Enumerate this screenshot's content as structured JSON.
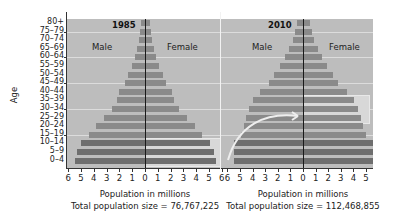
{
  "y_axis_label": "Age",
  "age_groups": [
    "80+",
    "75–79",
    "70–74",
    "65–69",
    "60–64",
    "55–59",
    "50–54",
    "45–49",
    "40–44",
    "35–39",
    "30–34",
    "25–29",
    "20–24",
    "15–19",
    "10–14",
    "5–9",
    "0–4"
  ],
  "charts": [
    {
      "year": "1985",
      "male_label": "Male",
      "female_label": "Female",
      "x_ticks_left": [
        "6",
        "5",
        "4",
        "3",
        "2",
        "1"
      ],
      "x_ticks_zero": "0",
      "x_ticks_right": [
        "1",
        "2",
        "3",
        "4",
        "5",
        "6"
      ],
      "xlabel": "Population in millions",
      "total_caption": "Total population size = 76,767,225"
    },
    {
      "year": "2010",
      "male_label": "Male",
      "female_label": "Female",
      "x_ticks_left": [
        "6",
        "5",
        "4",
        "3",
        "2",
        "1"
      ],
      "x_ticks_zero": "0",
      "x_ticks_right": [
        "1",
        "2",
        "3",
        "4",
        "5"
      ],
      "xlabel": "Population in millions",
      "total_caption": "Total population size = 112,468,855"
    }
  ],
  "colors": {
    "panel_bg": "#bdbdbd",
    "bar": "#8a8a8a",
    "bar_young": "#6e6e6e",
    "highlight": "#d8d8d8",
    "arrow": "#eeeeee"
  },
  "chart_data": [
    {
      "type": "bar",
      "title": "1985",
      "orientation": "horizontal",
      "subtype": "population pyramid",
      "categories": [
        "80+",
        "75–79",
        "70–74",
        "65–69",
        "60–64",
        "55–59",
        "50–54",
        "45–49",
        "40–44",
        "35–39",
        "30–34",
        "25–29",
        "20–24",
        "15–19",
        "10–14",
        "5–9",
        "0–4"
      ],
      "series": [
        {
          "name": "Male",
          "values": [
            0.3,
            0.4,
            0.5,
            0.6,
            0.8,
            1.0,
            1.3,
            1.6,
            2.0,
            2.2,
            2.6,
            3.2,
            3.8,
            4.4,
            5.0,
            5.3,
            5.5
          ]
        },
        {
          "name": "Female",
          "values": [
            0.3,
            0.4,
            0.5,
            0.6,
            0.8,
            1.0,
            1.3,
            1.6,
            2.0,
            2.2,
            2.6,
            3.2,
            3.8,
            4.4,
            5.0,
            5.3,
            5.5
          ]
        }
      ],
      "xlabel": "Population in millions",
      "ylabel": "Age",
      "xlim": [
        -6,
        6
      ],
      "annotations": [
        "Total population size = 76,767,225",
        "Ages 0–14 female bars highlighted"
      ],
      "grid": "horizontal lines at 15–19, 30–34, 45–49, 60–64, 75–79"
    },
    {
      "type": "bar",
      "title": "2010",
      "orientation": "horizontal",
      "subtype": "population pyramid",
      "categories": [
        "80+",
        "75–79",
        "70–74",
        "65–69",
        "60–64",
        "55–59",
        "50–54",
        "45–49",
        "40–44",
        "35–39",
        "30–34",
        "25–29",
        "20–24",
        "15–19",
        "10–14",
        "5–9",
        "0–4"
      ],
      "series": [
        {
          "name": "Male",
          "values": [
            0.5,
            0.6,
            0.8,
            1.1,
            1.4,
            1.8,
            2.3,
            2.7,
            3.4,
            4.0,
            4.3,
            4.5,
            4.7,
            4.9,
            5.5,
            5.5,
            5.5
          ]
        },
        {
          "name": "Female",
          "values": [
            0.5,
            0.6,
            0.8,
            1.1,
            1.4,
            1.8,
            2.3,
            2.7,
            3.4,
            4.0,
            4.3,
            4.5,
            4.7,
            4.9,
            5.5,
            5.5,
            5.5
          ]
        }
      ],
      "xlabel": "Population in millions",
      "ylabel": "Age",
      "xlim": [
        -6,
        5
      ],
      "annotations": [
        "Total population size = 112,468,855",
        "Ages 25–39 female bars highlighted; arrow from 1985 ages 0–14 to 2010 ages 25–39"
      ],
      "grid": "horizontal lines at 15–19, 30–34, 45–49, 60–64, 75–79"
    }
  ]
}
